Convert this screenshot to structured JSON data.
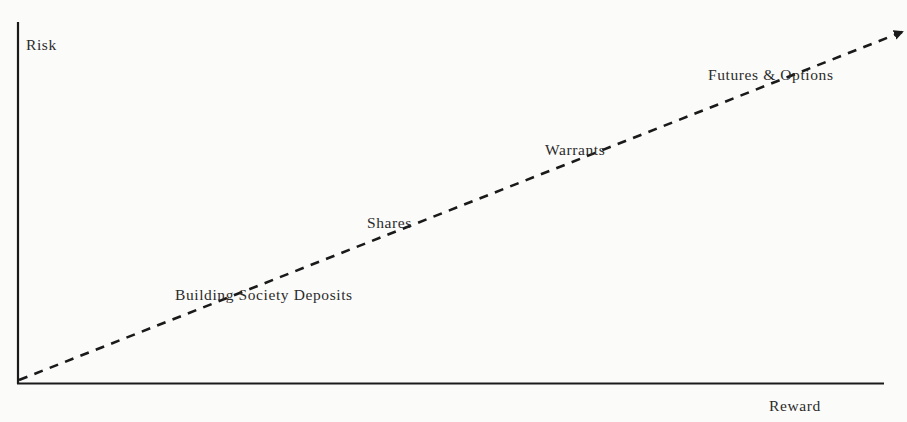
{
  "diagram": {
    "type": "risk-reward line",
    "y_axis_label": "Risk",
    "x_axis_label": "Reward",
    "line_style": "dashed arrow",
    "colors": {
      "background": "#fbfbfa",
      "ink": "#1a1a1a",
      "text": "#2b2b2b"
    },
    "items": [
      {
        "label": "Building Society Deposits",
        "order": 1
      },
      {
        "label": "Shares",
        "order": 2
      },
      {
        "label": "Warrants",
        "order": 3
      },
      {
        "label": "Futures & Options",
        "order": 4
      }
    ]
  }
}
